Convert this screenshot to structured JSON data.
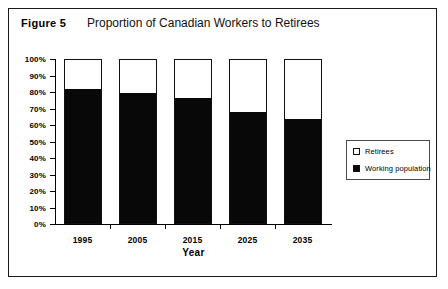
{
  "figure": {
    "number": "Figure 5",
    "title": "Proportion of Canadian Workers to Retirees"
  },
  "chart_data": {
    "type": "bar",
    "subtype": "stacked-100-percent",
    "title": "Proportion of Canadian Workers to Retirees",
    "xlabel": "Year",
    "ylabel": "",
    "categories": [
      "1995",
      "2005",
      "2015",
      "2025",
      "2035"
    ],
    "series": [
      {
        "name": "Working population",
        "color": "#080808",
        "values": [
          81,
          79,
          76,
          67,
          63
        ]
      },
      {
        "name": "Retirees",
        "color": "#ffffff",
        "values": [
          19,
          21,
          24,
          33,
          37
        ]
      }
    ],
    "ylim": [
      0,
      100
    ],
    "ytick_labels": [
      "100%",
      "90%",
      "80%",
      "70%",
      "60%",
      "50%",
      "40%",
      "30%",
      "20%",
      "10%",
      "0%"
    ],
    "ytick_values": [
      100,
      90,
      80,
      70,
      60,
      50,
      40,
      30,
      20,
      10,
      0
    ],
    "grid": false,
    "legend_position": "right"
  },
  "legend": {
    "items": [
      {
        "label": "Retirees",
        "style": "hollow"
      },
      {
        "label": "Working population",
        "style": "filled"
      }
    ]
  }
}
